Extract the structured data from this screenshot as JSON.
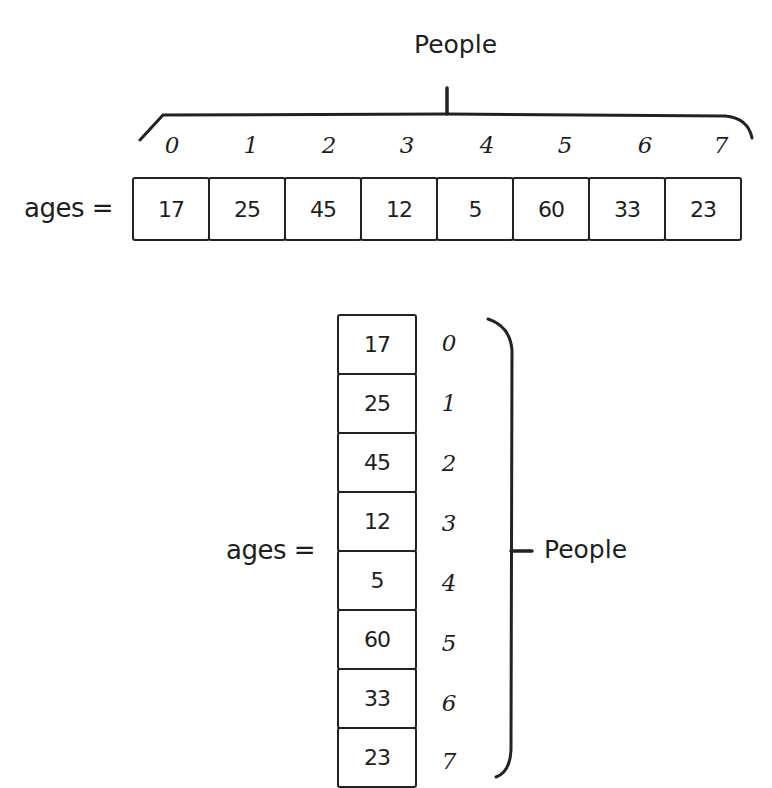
{
  "horizontal": {
    "group_label": "People",
    "variable_label": "ages =",
    "indices": [
      "0",
      "1",
      "2",
      "3",
      "4",
      "5",
      "6",
      "7"
    ],
    "values": [
      "17",
      "25",
      "45",
      "12",
      "5",
      "60",
      "33",
      "23"
    ]
  },
  "vertical": {
    "group_label": "People",
    "variable_label": "ages =",
    "indices": [
      "0",
      "1",
      "2",
      "3",
      "4",
      "5",
      "6",
      "7"
    ],
    "values": [
      "17",
      "25",
      "45",
      "12",
      "5",
      "60",
      "33",
      "23"
    ]
  },
  "colors": {
    "ink": "#1e1e1e",
    "background": "#ffffff"
  }
}
